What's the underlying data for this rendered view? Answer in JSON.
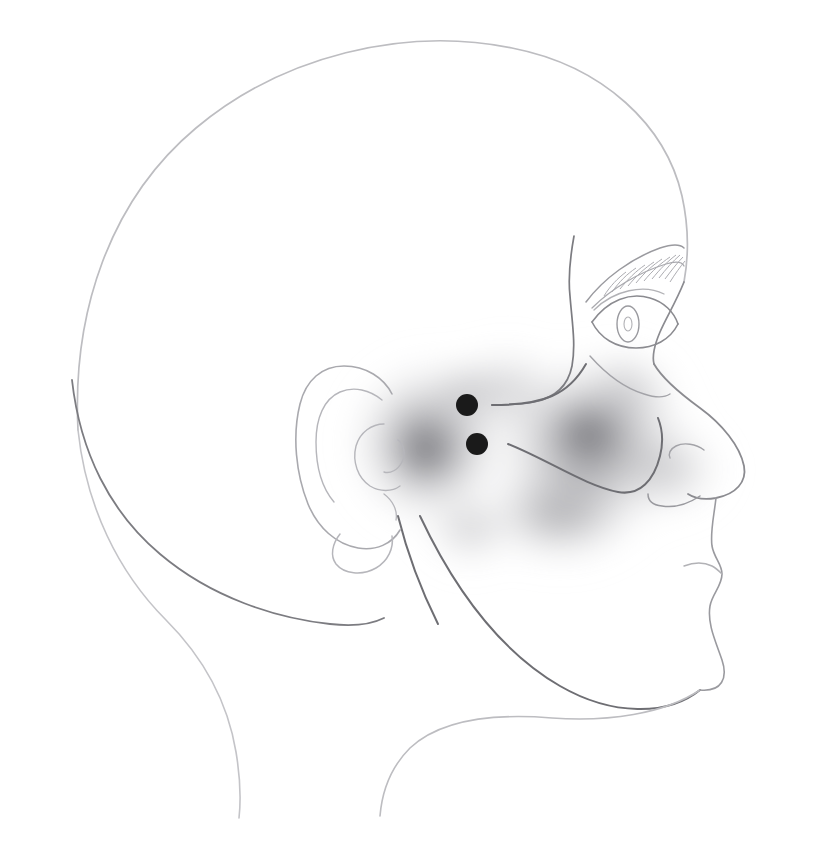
{
  "figure": {
    "background_color": "#ffffff",
    "width": 813,
    "height": 846,
    "caption": ""
  },
  "palette": {
    "outline_light": "#c9c9cc",
    "outline_mid": "#a6a6aa",
    "outline_dark": "#6e6e73",
    "outline_face": "#8b8b90",
    "shade_core": "#6f6f74",
    "shade_mid": "#9a9a9f",
    "shade_edge": "#d6d6d9",
    "marker_fill": "#1a1a1a"
  },
  "anatomy": {
    "regions": [
      {
        "name": "cranium",
        "label": "Cranium / skull vault"
      },
      {
        "name": "forehead",
        "label": "Forehead"
      },
      {
        "name": "occiput",
        "label": "Occiput / nape"
      },
      {
        "name": "ear",
        "label": "Auricle (external ear)"
      },
      {
        "name": "eye",
        "label": "Eye"
      },
      {
        "name": "eyebrow",
        "label": "Eyebrow"
      },
      {
        "name": "nose",
        "label": "Nose"
      },
      {
        "name": "mouth",
        "label": "Mouth / lips"
      },
      {
        "name": "chin",
        "label": "Chin"
      },
      {
        "name": "jaw",
        "label": "Mandible / jawline"
      },
      {
        "name": "neck",
        "label": "Neck"
      },
      {
        "name": "zygomatic-arch",
        "label": "Zygomatic arch"
      },
      {
        "name": "cheek",
        "label": "Cheek"
      }
    ],
    "ear_parts": [
      {
        "name": "helix",
        "label": "Helix"
      },
      {
        "name": "antihelix",
        "label": "Antihelix"
      },
      {
        "name": "concha",
        "label": "Concha"
      },
      {
        "name": "tragus",
        "label": "Tragus"
      },
      {
        "name": "lobule",
        "label": "Ear lobe"
      }
    ]
  },
  "shading_blobs": [
    {
      "id": "preauricular-blob",
      "label": "Preauricular / temporomandibular shaded region",
      "center_x": 428,
      "center_y": 443,
      "radius_x": 92,
      "radius_y": 96,
      "intensity": 0.62
    },
    {
      "id": "cheek-blob",
      "label": "Cheek / masseter shaded region",
      "center_x": 592,
      "center_y": 445,
      "radius_x": 118,
      "radius_y": 104,
      "intensity": 0.58
    },
    {
      "id": "temporal-blob",
      "label": "Temporal shaded region",
      "center_x": 508,
      "center_y": 392,
      "radius_x": 70,
      "radius_y": 58,
      "intensity": 0.3
    },
    {
      "id": "lower-cheek-blob",
      "label": "Lower cheek shaded extension",
      "center_x": 560,
      "center_y": 512,
      "radius_x": 96,
      "radius_y": 62,
      "intensity": 0.34
    },
    {
      "id": "infraorbital-blob",
      "label": "Infraorbital shaded extension",
      "center_x": 626,
      "center_y": 390,
      "radius_x": 62,
      "radius_y": 52,
      "intensity": 0.26
    }
  ],
  "markers": [
    {
      "id": "marker-upper",
      "label": "Trigger point marker (upper)",
      "x": 467,
      "y": 405,
      "radius": 11,
      "color": "#1a1a1a"
    },
    {
      "id": "marker-lower",
      "label": "Trigger point marker (lower)",
      "x": 477,
      "y": 444,
      "radius": 11,
      "color": "#1a1a1a"
    }
  ],
  "legend": {
    "visible": false,
    "items": []
  }
}
